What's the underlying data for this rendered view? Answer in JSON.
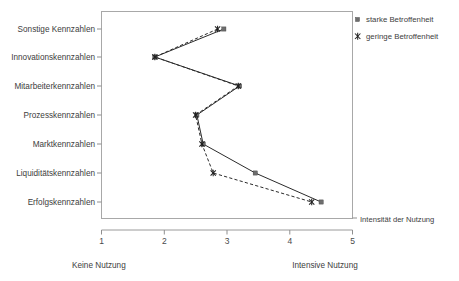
{
  "chart_data": {
    "type": "line",
    "orientation": "horizontal",
    "title": "",
    "subtitle": "",
    "xlabel": "Intensität der Nutzung",
    "ylabel": "",
    "xlim": [
      1,
      5
    ],
    "xticks": [
      "1",
      "2",
      "3",
      "4",
      "5"
    ],
    "grid": false,
    "legend_position": "top-right",
    "scale_anchor_low": "Keine Nutzung",
    "scale_anchor_high": "Intensive Nutzung",
    "categories": [
      "Sonstige Kennzahlen",
      "Innovationskennzahlen",
      "Mitarbeiterkennzahlen",
      "Prozesskennzahlen",
      "Marktkennzahlen",
      "Liquiditätskennzahlen",
      "Erfolgskennzahlen"
    ],
    "series": [
      {
        "name": "starke Betroffenheit",
        "marker": "square",
        "line_style": "solid",
        "color": "#2b2b2b",
        "values": [
          2.95,
          1.85,
          3.2,
          2.52,
          2.62,
          3.45,
          4.5
        ]
      },
      {
        "name": "geringe Betroffenheit",
        "marker": "x",
        "line_style": "dashed",
        "color": "#2b2b2b",
        "values": [
          2.85,
          1.85,
          3.18,
          2.5,
          2.6,
          2.78,
          4.35
        ]
      }
    ],
    "annotations": []
  },
  "legend": {
    "items": [
      {
        "label": "starke Betroffenheit",
        "marker": "square"
      },
      {
        "label": "geringe Betroffenheit",
        "marker": "x"
      }
    ]
  },
  "axis": {
    "x_title": "Intensität der Nutzung",
    "tick_1": "1",
    "tick_2": "2",
    "tick_3": "3",
    "tick_4": "4",
    "tick_5": "5",
    "anchor_low": "Keine Nutzung",
    "anchor_high": "Intensive Nutzung"
  },
  "categories": {
    "c0": "Sonstige Kennzahlen",
    "c1": "Innovationskennzahlen",
    "c2": "Mitarbeiterkennzahlen",
    "c3": "Prozesskennzahlen",
    "c4": "Marktkennzahlen",
    "c5": "Liquiditätskennzahlen",
    "c6": "Erfolgskennzahlen"
  }
}
